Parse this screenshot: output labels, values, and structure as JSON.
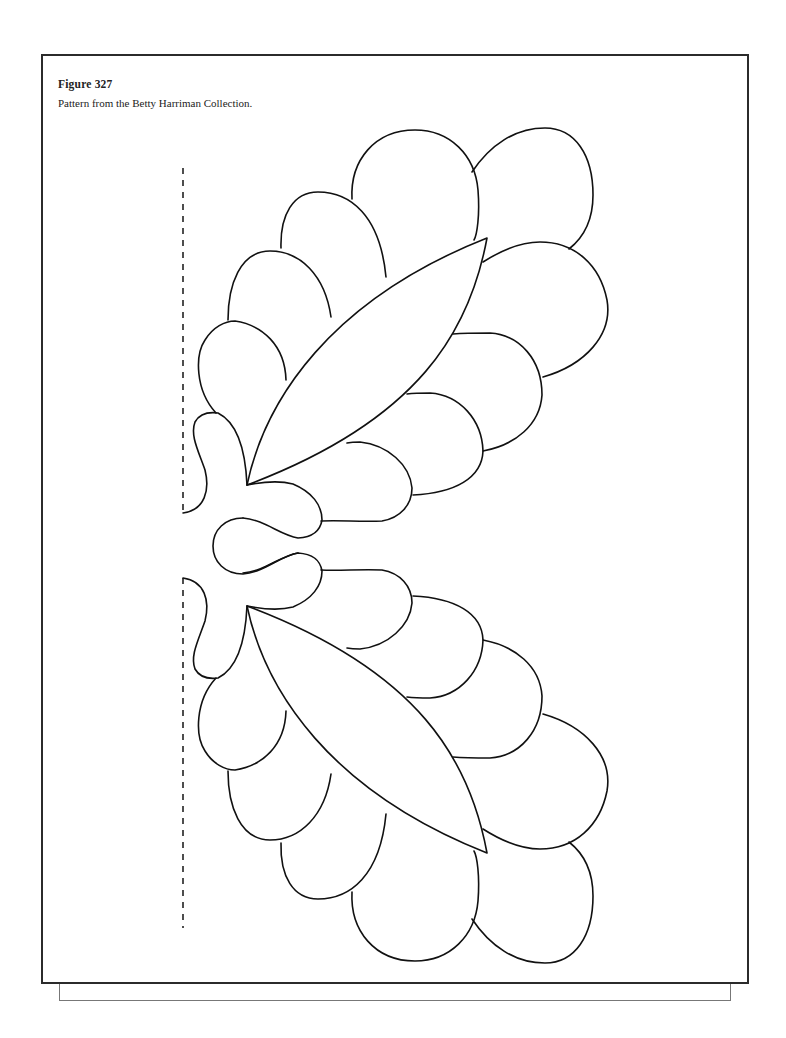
{
  "figure": {
    "number_label": "Figure 327",
    "description": "Pattern from the Betty Harriman Collection."
  },
  "pattern": {
    "type": "quilt appliqué half-pattern",
    "fold_line": "dashed",
    "symmetry": "mirrored top/bottom",
    "elements": [
      "scalloped petals",
      "pointed leaves",
      "center bud"
    ]
  },
  "colors": {
    "stroke": "#111111",
    "frame": "#2b2b2b",
    "shadow": "#777777",
    "background": "#ffffff"
  }
}
